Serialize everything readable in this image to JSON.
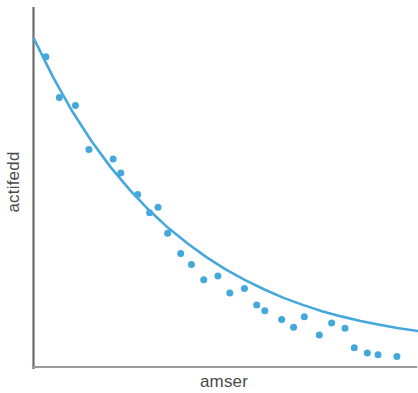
{
  "chart_data": {
    "type": "scatter",
    "title": "",
    "subtitle": "",
    "xlabel": "amser",
    "ylabel": "actifedd",
    "grid": false,
    "legend": false,
    "legend_position": "none",
    "axis_ticks": false,
    "axis_tick_labels": [],
    "xlim": [
      0,
      100
    ],
    "ylim": [
      0,
      100
    ],
    "series": [
      {
        "name": "data points",
        "type": "scatter",
        "color": "#45a8dc",
        "marker": "circle",
        "marker_size": 7,
        "x": [
          3.1,
          6.6,
          10.8,
          14.3,
          20.6,
          22.6,
          27.0,
          30.1,
          32.3,
          34.8,
          38.2,
          41.0,
          44.2,
          47.9,
          51.0,
          54.8,
          58.0,
          60.1,
          64.5,
          67.6,
          70.4,
          74.3,
          77.5,
          81.0,
          83.4,
          86.8,
          89.6,
          94.5
        ],
        "y": [
          88.9,
          77.2,
          74.9,
          62.3,
          59.6,
          55.6,
          49.4,
          44.2,
          45.8,
          38.3,
          32.5,
          29.4,
          25.0,
          26.1,
          21.2,
          22.5,
          17.8,
          16.1,
          13.6,
          11.4,
          14.4,
          9.2,
          12.6,
          11.1,
          5.5,
          4.0,
          3.5,
          3.0
        ]
      },
      {
        "name": "fitted exponential decay curve",
        "type": "line",
        "color": "#45a8dc",
        "line_width": 2.6,
        "x": [
          0,
          5,
          10,
          15,
          20,
          25,
          30,
          35,
          40,
          45,
          50,
          55,
          60,
          65,
          70,
          75,
          80,
          85,
          90,
          95,
          100
        ],
        "y": [
          94.0,
          83.0,
          73.2,
          64.7,
          57.2,
          50.7,
          44.9,
          39.8,
          35.4,
          31.4,
          27.9,
          24.9,
          22.2,
          19.8,
          17.8,
          16.0,
          14.5,
          13.2,
          12.1,
          11.1,
          10.3
        ]
      }
    ],
    "colors": {
      "data": "#45a8dc",
      "axis": "#6b6b6b",
      "label_text": "#4a4a4a",
      "background": "#ffffff"
    }
  },
  "figure": {
    "ylabel": "actifedd",
    "xlabel": "amser"
  }
}
